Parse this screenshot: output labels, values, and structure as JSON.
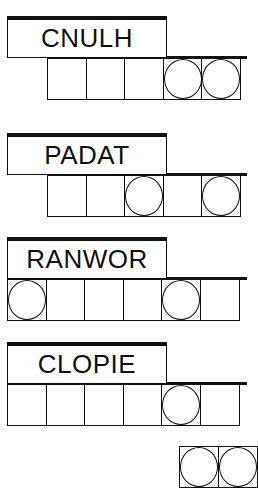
{
  "puzzles": [
    {
      "scrambled": "CNULH",
      "length": 5,
      "circled": [
        4,
        5
      ]
    },
    {
      "scrambled": "PADAT",
      "length": 5,
      "circled": [
        3,
        5
      ]
    },
    {
      "scrambled": "RANWOR",
      "length": 6,
      "circled": [
        1,
        5
      ]
    },
    {
      "scrambled": "CLOPIE",
      "length": 6,
      "circled": [
        5
      ]
    }
  ],
  "answer_row": {
    "partial_visible": true,
    "circled": [
      1,
      2
    ]
  }
}
